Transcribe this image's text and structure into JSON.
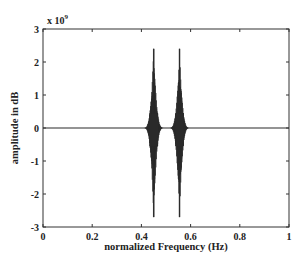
{
  "chart_data": {
    "type": "line",
    "title": "",
    "xlabel": "normalized Frequency (Hz)",
    "ylabel": "amplitude in dB",
    "y_multiplier": "x 10",
    "y_exponent": "9",
    "xlim": [
      0,
      1
    ],
    "ylim": [
      -3,
      3
    ],
    "x_ticks": [
      0,
      0.2,
      0.4,
      0.6,
      0.8,
      1
    ],
    "x_tick_labels": [
      "0",
      "0.2",
      "0.4",
      "0.6",
      "0.8",
      "1"
    ],
    "y_ticks": [
      -3,
      -2,
      -1,
      0,
      1,
      2,
      3
    ],
    "y_tick_labels": [
      "-3",
      "-2",
      "-1",
      "0",
      "1",
      "2",
      "3"
    ],
    "grid": false,
    "legend": null,
    "series": [
      {
        "name": "spectrum",
        "color": "#2a2a2a",
        "description": "Flat near zero except two symmetric oscillating bursts centered near 0.45 and 0.55",
        "bursts": [
          {
            "center": 0.45,
            "half_width": 0.04,
            "max": 2.4,
            "min": -2.7
          },
          {
            "center": 0.555,
            "half_width": 0.04,
            "max": 2.4,
            "min": -2.7
          }
        ]
      }
    ]
  }
}
